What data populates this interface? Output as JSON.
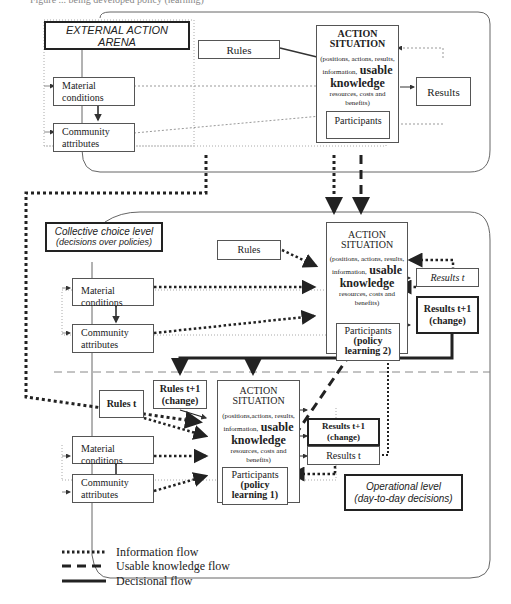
{
  "caption": "Figure ... being developed policy (learning)",
  "external_arena": {
    "title": "EXTERNAL ACTION ARENA",
    "rules": "Rules",
    "material_conditions": [
      "Material",
      "conditions"
    ],
    "community_attributes": [
      "Community",
      "attributes"
    ],
    "action_situation": {
      "title1": "ACTION",
      "title2": "SITUATION",
      "desc1": "(positions, actions, results,",
      "desc2": "information,",
      "usable": "usable",
      "knowledge": "knowledge",
      "desc3": "resources, costs and",
      "desc4": "benefits)",
      "participants": "Participants"
    },
    "results": "Results"
  },
  "collective_level": {
    "title": "Collective choice level",
    "subtitle": "(decisions over policies)",
    "rules": "Rules",
    "material_conditions": "Material conditions",
    "community_attributes": [
      "Community",
      "attributes"
    ],
    "action_situation": {
      "title1": "ACTION",
      "title2": "SITUATION",
      "desc1": "(positions, actions, results,",
      "desc2": "information,",
      "usable": "usable",
      "knowledge": "knowledge",
      "desc3": "resources, costs and",
      "desc4": "benefits)",
      "participants": "Participants",
      "participants_b1": "(policy",
      "participants_b2": "learning 2)"
    },
    "results_t": "Results t",
    "results_t1_a": "Results t+1",
    "results_t1_b": "(change)"
  },
  "operational_level": {
    "title": "Operational level",
    "subtitle": "(day-to-day decisions)",
    "rules_t": "Rules t",
    "rules_t1_a": "Rules t+1",
    "rules_t1_b": "(change)",
    "material_conditions": "Material conditions",
    "community_attributes": [
      "Community",
      "attributes"
    ],
    "action_situation": {
      "title1": "ACTION",
      "title2": "SITUATION",
      "desc1": "(positions,actions, results,",
      "desc2": "information,",
      "usable": "usable",
      "knowledge": "knowledge",
      "desc3": "resources, costs and",
      "desc4": "benefits)",
      "participants": "Participants",
      "participants_b1": "(policy",
      "participants_b2": "learning 1)"
    },
    "results_t1_a": "Results t+1",
    "results_t1_b": "(change)",
    "results_t": "Results t"
  },
  "legend": [
    {
      "style": "dotted",
      "label": "Information flow"
    },
    {
      "style": "dashed",
      "label": "Usable knowledge flow"
    },
    {
      "style": "solid",
      "label": "Decisional flow"
    }
  ]
}
